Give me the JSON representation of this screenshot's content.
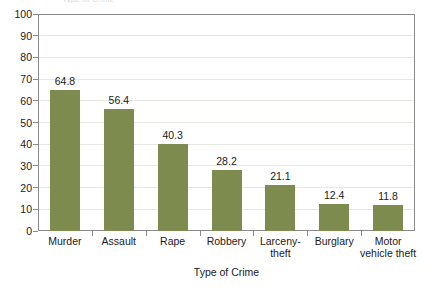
{
  "clipped_caption": "Type of Crime",
  "chart_data": {
    "type": "bar",
    "title": "",
    "xlabel": "Type of Crime",
    "ylabel": "",
    "ylim": [
      0,
      100
    ],
    "y_ticks": [
      0,
      10,
      20,
      30,
      40,
      50,
      60,
      70,
      80,
      90,
      100
    ],
    "y_tick_labels": [
      "0",
      "10",
      "20",
      "30",
      "40",
      "50",
      "60",
      "70",
      "80",
      "90",
      "100"
    ],
    "grid": true,
    "legend": false,
    "bar_color": "#7d8c4e",
    "categories": [
      "Murder",
      "Assault",
      "Rape",
      "Robbery",
      "Larceny- theft",
      "Burglary",
      "Motor vehicle theft"
    ],
    "category_lines": [
      [
        "Murder"
      ],
      [
        "Assault"
      ],
      [
        "Rape"
      ],
      [
        "Robbery"
      ],
      [
        "Larceny-",
        "theft"
      ],
      [
        "Burglary"
      ],
      [
        "Motor",
        "vehicle theft"
      ]
    ],
    "values": [
      64.8,
      56.4,
      40.3,
      28.2,
      21.1,
      12.4,
      11.8
    ],
    "value_labels": [
      "64.8",
      "56.4",
      "40.3",
      "28.2",
      "21.1",
      "12.4",
      "11.8"
    ]
  }
}
